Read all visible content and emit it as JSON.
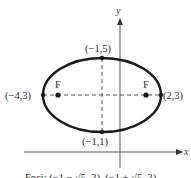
{
  "diagram": {
    "type": "ellipse",
    "axes": {
      "x_label": "x",
      "y_label": "y"
    },
    "vertices": [
      {
        "id": "left",
        "label": "(−4,3)"
      },
      {
        "id": "right",
        "label": "(2,3)"
      },
      {
        "id": "top",
        "label": "(−1,5)"
      },
      {
        "id": "bottom",
        "label": "(−1,1)"
      }
    ],
    "foci": [
      {
        "id": "left-focus",
        "label": "F"
      },
      {
        "id": "right-focus",
        "label": "F"
      }
    ],
    "caption": "Foci: (−1 − √5, 3), (−1 + √5, 3)",
    "colors": {
      "stroke": "#1a1a1a",
      "text": "#2a2a2a"
    }
  }
}
